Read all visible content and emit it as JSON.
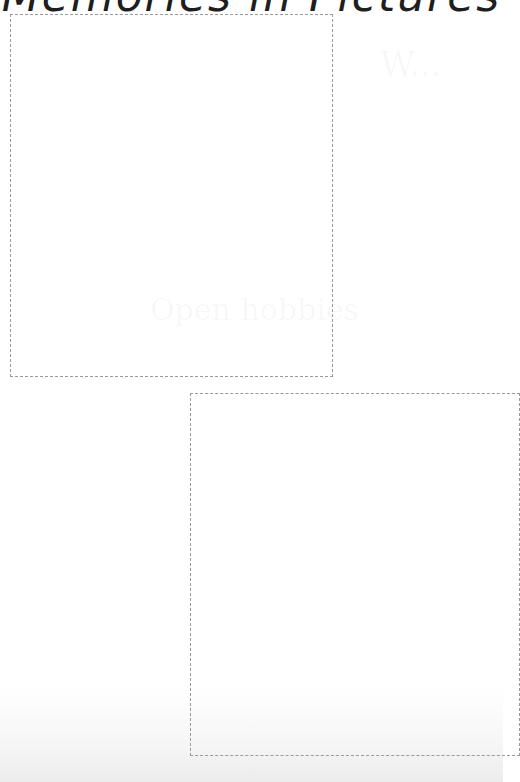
{
  "page": {
    "title": "Memories in Pictures",
    "background_color": "#ffffff",
    "title_color": "#1e1e1e",
    "frame_border_color": "#9a9a9a"
  },
  "frames": [
    {
      "label": "photo-frame-1",
      "content": ""
    },
    {
      "label": "photo-frame-2",
      "content": ""
    }
  ],
  "ghost_text": {
    "top_right": "W...",
    "middle": "Open hobbies",
    "lower": ""
  }
}
